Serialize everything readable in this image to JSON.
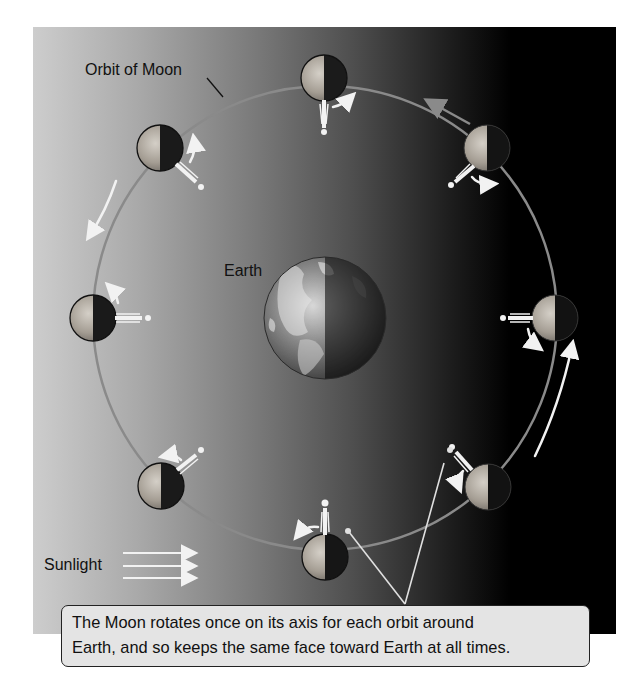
{
  "figure": {
    "labels": {
      "orbit": "Orbit of Moon",
      "earth": "Earth",
      "sunlight": "Sunlight"
    },
    "caption": {
      "line1": "The Moon rotates once on its axis for each orbit around",
      "line2": "Earth, and so keeps the same face toward Earth at all times."
    },
    "colors": {
      "panel_light": "#cdcdcd",
      "panel_dark": "#000000",
      "orbit_line": "#8a8a8a",
      "arrow": "#f2f2f2",
      "moon_lit": "#b9b3aa",
      "moon_dark": "#1b1b1b",
      "caption_bg": "#e4e4e4"
    },
    "earth": {
      "cx": 325,
      "cy": 318,
      "r": 61
    },
    "orbit": {
      "cx": 325,
      "cy": 318,
      "r": 232
    },
    "moons": [
      {
        "position": "top",
        "cx": 324,
        "cy": 78
      },
      {
        "position": "top-right",
        "cx": 487,
        "cy": 148
      },
      {
        "position": "right",
        "cx": 555,
        "cy": 318
      },
      {
        "position": "bottom-right",
        "cx": 488,
        "cy": 487
      },
      {
        "position": "bottom",
        "cx": 325,
        "cy": 557
      },
      {
        "position": "bottom-left",
        "cx": 161,
        "cy": 486
      },
      {
        "position": "left",
        "cx": 93,
        "cy": 318
      },
      {
        "position": "top-left",
        "cx": 160,
        "cy": 148
      }
    ],
    "moon_radius": 23
  }
}
